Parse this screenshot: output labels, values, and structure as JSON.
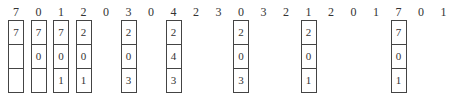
{
  "reference_string": [
    "7",
    "0",
    "1",
    "2",
    "0",
    "3",
    "0",
    "4",
    "2",
    "3",
    "0",
    "3",
    "2",
    "1",
    "2",
    "0",
    "1",
    "7",
    "0",
    "1"
  ],
  "frames": [
    {
      "index": 0,
      "cells": [
        "7",
        "",
        ""
      ]
    },
    {
      "index": 1,
      "cells": [
        "7",
        "0",
        ""
      ]
    },
    {
      "index": 2,
      "cells": [
        "7",
        "0",
        "1"
      ]
    },
    {
      "index": 3,
      "cells": [
        "2",
        "0",
        "1"
      ]
    },
    {
      "index": 5,
      "cells": [
        "2",
        "0",
        "3"
      ]
    },
    {
      "index": 7,
      "cells": [
        "2",
        "4",
        "3"
      ]
    },
    {
      "index": 10,
      "cells": [
        "2",
        "0",
        "3"
      ]
    },
    {
      "index": 13,
      "cells": [
        "2",
        "0",
        "1"
      ]
    },
    {
      "index": 17,
      "cells": [
        "7",
        "0",
        "1"
      ]
    }
  ]
}
